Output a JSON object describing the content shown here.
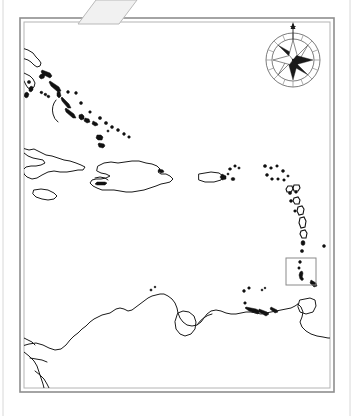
{
  "document": {
    "kind": "scanned-outline-map",
    "title": "Caribbean Region Outline Map",
    "width_px": 354,
    "height_px": 416,
    "background_color": "#ffffff",
    "ink_color": "#1a1a1a",
    "frame_color": "#8e8e8e",
    "has_visible_labels": false,
    "notes_text": ""
  },
  "frame": {
    "name": "map-border",
    "style": "double-rule rectangle",
    "outer": {
      "x": 20,
      "y": 18,
      "width": 314,
      "height": 374
    },
    "inner": {
      "x": 24,
      "y": 22,
      "width": 306,
      "height": 366
    },
    "left_margin_rule_x": 3,
    "right_margin_rule_x": 350,
    "outer_color": "#8e8e8e",
    "inner_color": "#b4b4b4"
  },
  "page_artifact": {
    "name": "paper-fold-flap",
    "description": "light grey diagonal paper flap overlapping the top border",
    "fill": "#f1f1f1",
    "stroke": "#b9b9b9",
    "points": "96,0 137,0 119,24 78,24"
  },
  "compass_rose": {
    "name": "compass-rose",
    "center_x": 293,
    "center_y": 60,
    "outer_radius": 27,
    "inner_radius": 21,
    "star_points": 8,
    "segments": 16,
    "has_north_needle": true,
    "needle_length": 18,
    "ring_color": "#6d6d6d",
    "point_dark_color": "#1a1a1a",
    "point_light_color": "#ffffff"
  },
  "inset_box": {
    "name": "inset-highlight-box",
    "description": "rectangular highlight box drawn around a small island in the southern Lesser Antilles",
    "x": 286,
    "y": 258,
    "width": 30,
    "height": 27,
    "stroke": "#8a8a8a",
    "label": ""
  },
  "map_content": {
    "region": "Caribbean Sea, Greater Antilles, Lesser Antilles and northern South America",
    "landmass_groups": [
      {
        "name": "florida-peninsula",
        "type": "coastline",
        "description": "southern tip of the Florida peninsula at upper-left"
      },
      {
        "name": "bahamas-archipelago",
        "type": "island-chain",
        "description": "chain of elongated filled islets running north-west to south-east"
      },
      {
        "name": "cuba",
        "type": "island",
        "description": "long outlined island across the middle-left of the frame"
      },
      {
        "name": "jamaica",
        "type": "island",
        "description": "small outlined island south-west of Cuba"
      },
      {
        "name": "hispaniola",
        "type": "island",
        "description": "large outlined island east of Cuba (Haiti and Dominican Republic)"
      },
      {
        "name": "puerto-rico",
        "type": "island",
        "description": "outlined rectangular island east of Hispaniola"
      },
      {
        "name": "virgin-islands",
        "type": "islet-cluster",
        "description": "small filled dots east of Puerto Rico"
      },
      {
        "name": "leeward-islands",
        "type": "island-chain",
        "description": "arc of small filled islets curving south-east"
      },
      {
        "name": "windward-islands",
        "type": "island-chain",
        "description": "arc of small filled islets continuing south toward South America"
      },
      {
        "name": "barbados-highlight",
        "type": "island",
        "description": "small island enclosed by the rectangular highlight box"
      },
      {
        "name": "trinidad",
        "type": "island",
        "description": "outlined island off the north-east coast of South America"
      },
      {
        "name": "south-america-coast",
        "type": "coastline",
        "description": "northern coast of Colombia and Venezuela including Lake Maracaibo and the Orinoco delta"
      },
      {
        "name": "central-america-coast",
        "type": "coastline",
        "description": "short coastline fragment at the lower-left corner"
      },
      {
        "name": "netherlands-antilles",
        "type": "islet-cluster",
        "description": "small dots off the Venezuelan coast"
      }
    ]
  }
}
